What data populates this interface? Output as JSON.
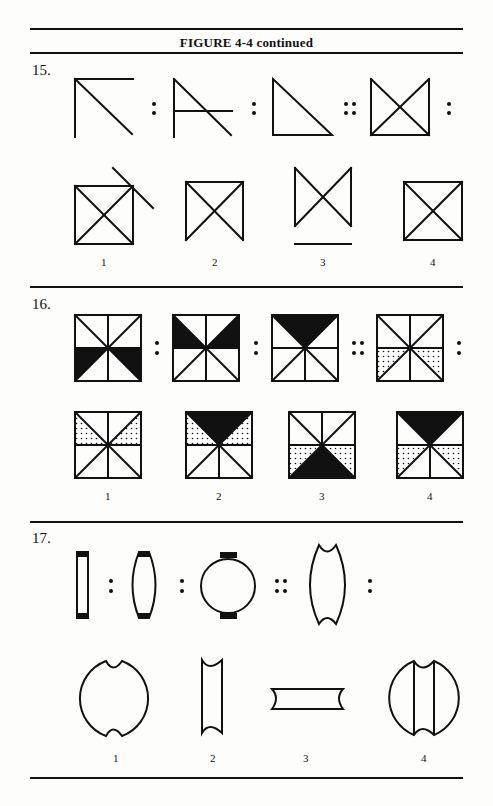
{
  "figure": {
    "title": "FIGURE 4-4 continued"
  },
  "questions": [
    {
      "number": "15.",
      "stem_separators": [
        ":",
        ":",
        "::",
        ":"
      ],
      "stem_figures": [
        "angle-with-diagonal",
        "angle-with-diagonal-and-horizontal",
        "right-triangle",
        "square-with-x-open-top"
      ],
      "options": [
        {
          "label": "1",
          "figure": "square-with-x-and-extended-diagonal"
        },
        {
          "label": "2",
          "figure": "square-with-x-open-bottom"
        },
        {
          "label": "3",
          "figure": "bowtie-with-separate-base-line"
        },
        {
          "label": "4",
          "figure": "square-with-x"
        }
      ]
    },
    {
      "number": "16.",
      "stem_separators": [
        ":",
        ":",
        "::",
        ":"
      ],
      "stem_figures": [
        "octant-square-bottom-black",
        "octant-square-middle-black",
        "octant-square-top-black",
        "octant-square-bottom-dotted"
      ],
      "options": [
        {
          "label": "1",
          "figure": "octant-square-upper-sides-dotted"
        },
        {
          "label": "2",
          "figure": "octant-square-top-black-upper-sides-dotted"
        },
        {
          "label": "3",
          "figure": "octant-square-bottom-black-lower-sides-dotted"
        },
        {
          "label": "4",
          "figure": "octant-square-top-black-lower-sides-dotted"
        }
      ]
    },
    {
      "number": "17.",
      "stem_separators": [
        ":",
        ":",
        "::",
        ":"
      ],
      "stem_figures": [
        "narrow-rectangle-capped",
        "lens-capped",
        "circle-capped",
        "concave-notched-barrel"
      ],
      "options": [
        {
          "label": "1",
          "figure": "notched-circle"
        },
        {
          "label": "2",
          "figure": "narrow-concave-column"
        },
        {
          "label": "3",
          "figure": "horizontal-concave-bar"
        },
        {
          "label": "4",
          "figure": "notched-circle-with-column"
        }
      ]
    }
  ]
}
